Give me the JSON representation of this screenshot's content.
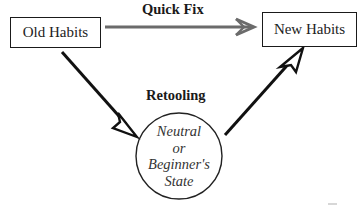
{
  "diagram": {
    "type": "process-flow",
    "nodes": {
      "old_habits": {
        "label": "Old Habits",
        "shape": "rectangle"
      },
      "new_habits": {
        "label": "New Habits",
        "shape": "rectangle"
      },
      "neutral_state": {
        "shape": "circle",
        "lines": [
          "Neutral",
          "or",
          "Beginner's",
          "State"
        ]
      }
    },
    "edges": [
      {
        "from": "old_habits",
        "to": "new_habits",
        "label": "Quick Fix",
        "color": "#6b6b6b",
        "head": "open-chevron"
      },
      {
        "from": "old_habits",
        "to": "neutral_state",
        "label": "Retooling",
        "color": "#111111",
        "head": "open-triangle"
      },
      {
        "from": "neutral_state",
        "to": "new_habits",
        "label": "",
        "color": "#111111",
        "head": "open-triangle"
      }
    ],
    "labels": {
      "quick_fix": "Quick Fix",
      "retooling": "Retooling"
    }
  },
  "colors": {
    "background": "#ffffff",
    "ink": "#1a1a1a",
    "quick_fix_arrow": "#6b6b6b"
  }
}
